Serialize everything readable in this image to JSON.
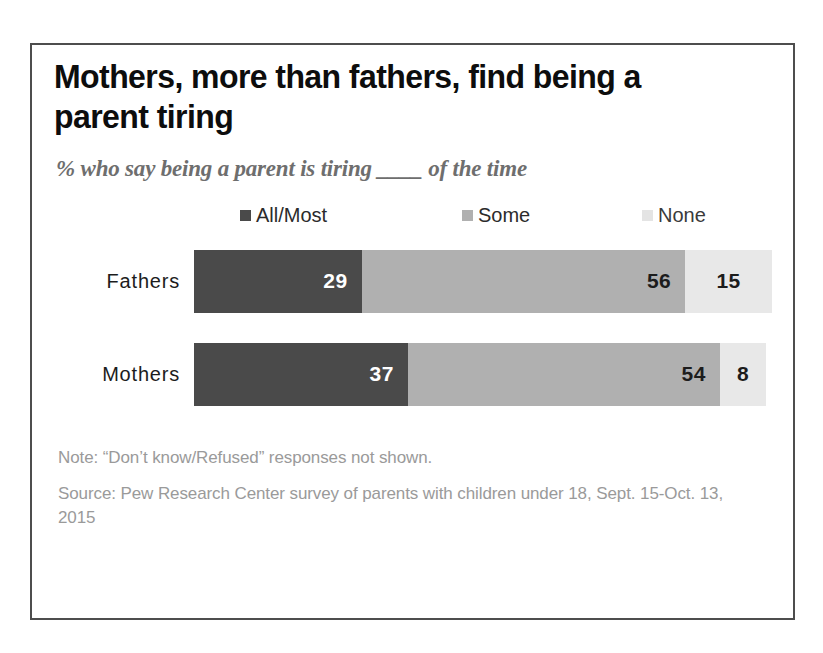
{
  "figure": {
    "title": "Mothers, more than fathers, find being a\nparent tiring",
    "subtitle": "% who say being a parent is tiring ____ of the time",
    "note": "Note: “Don’t know/Refused” responses not shown.",
    "source": "Source: Pew Research Center survey of parents with children under 18, Sept. 15-Oct. 13, 2015",
    "border_color": "#4d4d4d",
    "background": "#ffffff"
  },
  "legend": {
    "items": [
      {
        "label": "All/Most",
        "color": "#4a4a4a",
        "swatch_icon": "square-marker-icon"
      },
      {
        "label": "Some",
        "color": "#b0b0b0",
        "swatch_icon": "square-marker-icon"
      },
      {
        "label": "None",
        "color": "#e4e4e4",
        "swatch_icon": "square-marker-icon"
      }
    ]
  },
  "chart_data": {
    "type": "bar",
    "orientation": "horizontal",
    "stacked": true,
    "stacked_percent": true,
    "title": "Mothers, more than fathers, find being a parent tiring",
    "subtitle": "% who say being a parent is tiring ____ of the time",
    "xlabel": "",
    "ylabel": "",
    "xlim": [
      0,
      100
    ],
    "grid": false,
    "legend_position": "top",
    "categories": [
      "Fathers",
      "Mothers"
    ],
    "series": [
      {
        "name": "All/Most",
        "color": "#4a4a4a",
        "values": [
          29,
          37
        ]
      },
      {
        "name": "Some",
        "color": "#b0b0b0",
        "values": [
          56,
          54
        ]
      },
      {
        "name": "None",
        "color": "#e4e4e4",
        "values": [
          15,
          8
        ]
      }
    ],
    "rows": [
      {
        "category": "Fathers",
        "segments": [
          {
            "name": "All/Most",
            "value": 29,
            "label": "29",
            "color": "#4a4a4a",
            "text_color": "#ffffff"
          },
          {
            "name": "Some",
            "value": 56,
            "label": "56",
            "color": "#b0b0b0",
            "text_color": "#1c1c1c"
          },
          {
            "name": "None",
            "value": 15,
            "label": "15",
            "color": "#e8e8e8",
            "text_color": "#1c1c1c"
          }
        ]
      },
      {
        "category": "Mothers",
        "segments": [
          {
            "name": "All/Most",
            "value": 37,
            "label": "37",
            "color": "#4a4a4a",
            "text_color": "#ffffff"
          },
          {
            "name": "Some",
            "value": 54,
            "label": "54",
            "color": "#b0b0b0",
            "text_color": "#1c1c1c"
          },
          {
            "name": "None",
            "value": 8,
            "label": "8",
            "color": "#e8e8e8",
            "text_color": "#1c1c1c"
          }
        ]
      }
    ],
    "annotations": [
      "Note: “Don’t know/Refused” responses not shown.",
      "Source: Pew Research Center survey of parents with children under 18, Sept. 15-Oct. 13, 2015"
    ]
  }
}
